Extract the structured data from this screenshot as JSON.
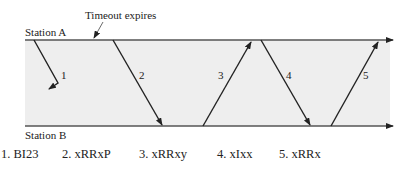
{
  "stations": {
    "a": "Station A",
    "b": "Station B"
  },
  "annotation": "Timeout expires",
  "frames": [
    {
      "num": "1",
      "label": "1. BI23"
    },
    {
      "num": "2",
      "label": "2. xRRxP"
    },
    {
      "num": "3",
      "label": "3. xRRxy"
    },
    {
      "num": "4",
      "label": "4. xIxx"
    },
    {
      "num": "5",
      "label": "5. xRRx"
    }
  ],
  "colors": {
    "band": "#eeeeee",
    "line": "#222222"
  }
}
